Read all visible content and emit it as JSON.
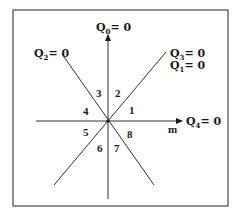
{
  "diagram": {
    "labels": {
      "q0": {
        "main": "Q",
        "sub": "0",
        "eq": "= 0"
      },
      "q2": {
        "main": "Q",
        "sub": "2",
        "eq": "= 0"
      },
      "q3": {
        "main": "Q",
        "sub": "3",
        "eq": "= 0"
      },
      "q1": {
        "main": "Q",
        "sub": "1",
        "eq": "= 0"
      },
      "q4": {
        "main": "Q",
        "sub": "4",
        "eq": "= 0"
      },
      "m_axis": "m"
    },
    "regions": [
      "1",
      "2",
      "3",
      "4",
      "5",
      "6",
      "7",
      "8"
    ],
    "colors": {
      "line": "#1a1a1a",
      "frame": "#555555"
    }
  }
}
